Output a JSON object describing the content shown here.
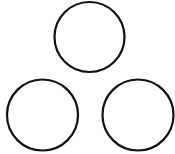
{
  "canvas": {
    "width": 175,
    "height": 154,
    "background": "#ffffff"
  },
  "style": {
    "stroke": "#111111",
    "stroke_width": 2.2,
    "fill": "none"
  },
  "shapes": [
    {
      "name": "circle-top",
      "type": "circle",
      "cx": 89.5,
      "cy": 37,
      "r": 35
    },
    {
      "name": "circle-bottom-left",
      "type": "circle",
      "cx": 42.5,
      "cy": 115,
      "r": 35.5
    },
    {
      "name": "circle-bottom-right",
      "type": "circle",
      "cx": 138,
      "cy": 115,
      "r": 35.5
    }
  ]
}
